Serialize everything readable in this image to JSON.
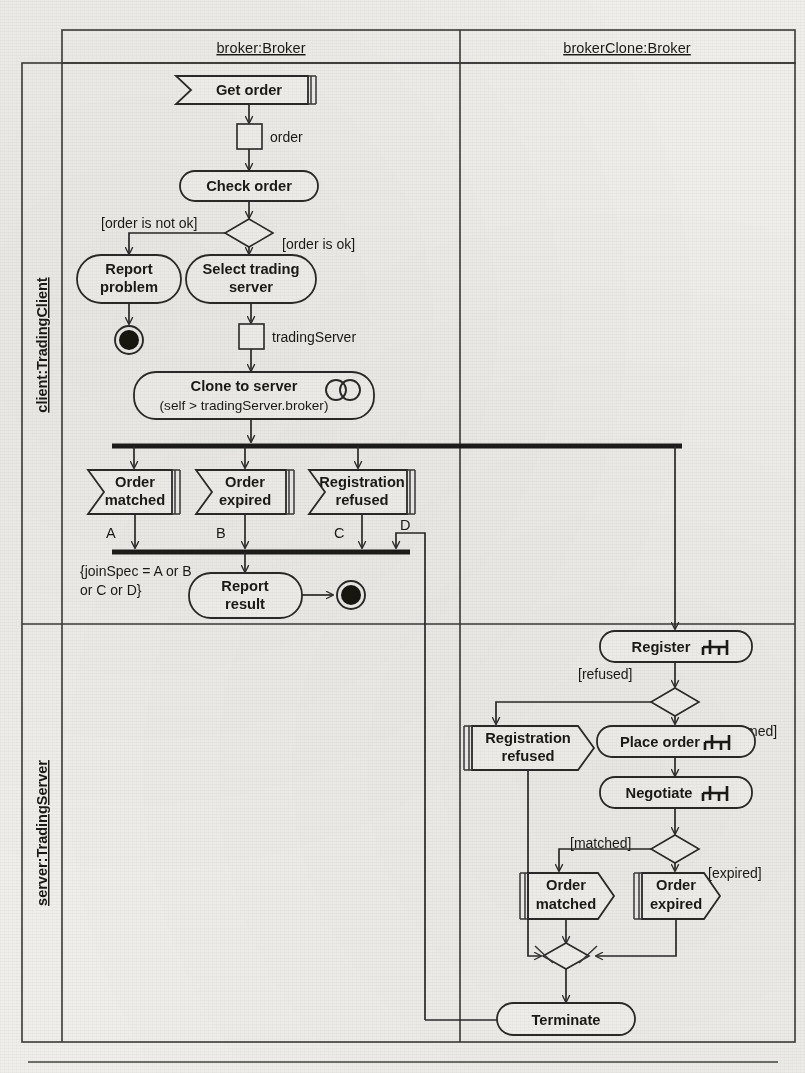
{
  "diagram": {
    "type": "uml-activity-diagram",
    "title": "",
    "partitions": {
      "columns": [
        {
          "id": "broker",
          "label": "broker:Broker"
        },
        {
          "id": "brokerClone",
          "label": "brokerClone:Broker"
        }
      ],
      "rows": [
        {
          "id": "client",
          "label": "client:TradingClient"
        },
        {
          "id": "server",
          "label": "server:TradingServer"
        }
      ]
    },
    "nodes": {
      "get_order": {
        "label": "Get order",
        "kind": "accept-event-action"
      },
      "order_pin": {
        "label": "order",
        "kind": "object-node"
      },
      "check_order": {
        "label": "Check order",
        "kind": "action"
      },
      "report_problem": {
        "label": "Report\nproblem",
        "line1": "Report",
        "line2": "problem",
        "kind": "action"
      },
      "select_trading_server": {
        "line1": "Select trading",
        "line2": "server",
        "kind": "action"
      },
      "trading_server_pin": {
        "label": "tradingServer",
        "kind": "object-node"
      },
      "clone_to_server": {
        "line1": "Clone to server",
        "line2": "(self > tradingServer.broker)",
        "kind": "action",
        "icon": "clone-icon"
      },
      "accept_order_matched": {
        "line1": "Order",
        "line2": "matched",
        "kind": "accept-event-action"
      },
      "accept_order_expired": {
        "line1": "Order",
        "line2": "expired",
        "kind": "accept-event-action"
      },
      "accept_registration_refused": {
        "line1": "Registration",
        "line2": "refused",
        "kind": "accept-event-action"
      },
      "report_result": {
        "line1": "Report",
        "line2": "result",
        "kind": "action"
      },
      "register": {
        "label": "Register",
        "kind": "call-behavior-action",
        "icon": "rake-icon"
      },
      "send_registration_refused": {
        "line1": "Registration",
        "line2": "refused",
        "kind": "send-signal-action"
      },
      "place_order": {
        "label": "Place order",
        "kind": "call-behavior-action",
        "icon": "rake-icon"
      },
      "negotiate": {
        "label": "Negotiate",
        "kind": "call-behavior-action",
        "icon": "rake-icon"
      },
      "send_order_matched": {
        "line1": "Order",
        "line2": "matched",
        "kind": "send-signal-action"
      },
      "send_order_expired": {
        "line1": "Order",
        "line2": "expired",
        "kind": "send-signal-action"
      },
      "terminate": {
        "label": "Terminate",
        "kind": "action"
      },
      "final_1": {
        "kind": "activity-final-node"
      },
      "final_2": {
        "kind": "activity-final-node"
      }
    },
    "guards": {
      "order_not_ok": "[order is not ok]",
      "order_ok": "[order is ok]",
      "refused": "[refused]",
      "confirmed": "[confirmed]",
      "matched": "[matched]",
      "expired": "[expired]"
    },
    "edge_labels": {
      "a": "A",
      "b": "B",
      "c": "C",
      "d": "D"
    },
    "constraint": {
      "line1": "{joinSpec = A or B",
      "line2": "or C or D}"
    },
    "colors": {
      "ink": "#1b1a17",
      "line": "#2b2a28",
      "frame": "#3b3a38",
      "paper": "#efeeea",
      "shape_fill": "#f2f1ed",
      "node_solid": "#17160f"
    }
  }
}
